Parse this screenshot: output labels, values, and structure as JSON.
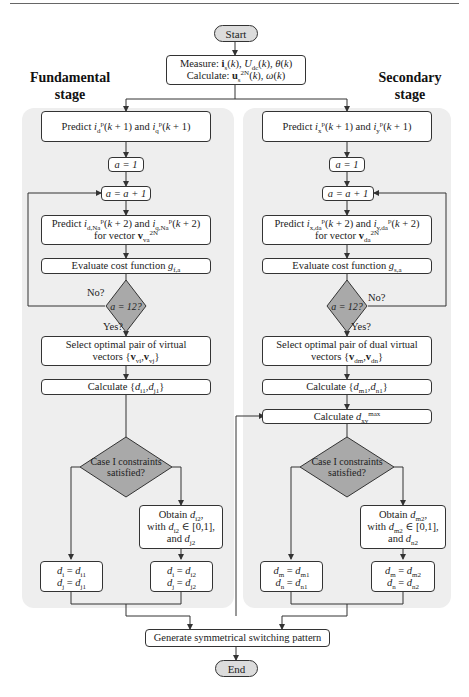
{
  "flowchart": {
    "start": "Start",
    "end": "End",
    "init": {
      "line1_prefix": "Measure: ",
      "line1_vars": "i s (k), U dc (k), θ(k)",
      "line2_prefix": "Calculate: ",
      "line2_vars": "u s 2N (k), ω(k)"
    },
    "generate": "Generate symmetrical switching pattern"
  },
  "fundamental": {
    "title_line1": "Fundamental",
    "title_line2": "stage",
    "predict1": "Predict i_d^p(k+1) and i_q^p(k+1)",
    "init_a": "a = 1",
    "increment": "a = a + 1",
    "predict2_line1": "Predict i_d,Na^p(k+2) and i_q,Na^p(k+2)",
    "predict2_line2": "for vector v_va^2N",
    "evaluate": "Evaluate cost function g_f,a",
    "decision": "a = 12?",
    "no": "No?",
    "yes": "Yes?",
    "select_line1": "Select optimal pair of virtual",
    "select_line2": "vectors {v_vi, v_vj}",
    "calc": "Calculate {d_i1, d_j1}",
    "case_line1": "Case I constraints",
    "case_line2": "satisfied?",
    "obtain_line1": "Obtain d_i2,",
    "obtain_line2": "with d_i2 ∈ [0,1],",
    "obtain_line3": "and d_j2",
    "result1_line1": "d_i = d_i1",
    "result1_line2": "d_j = d_j1",
    "result2_line1": "d_i = d_i2",
    "result2_line2": "d_j = d_j2"
  },
  "secondary": {
    "title_line1": "Secondary",
    "title_line2": "stage",
    "predict1": "Predict i_x^p(k+1) and i_y^p(k+1)",
    "init_a": "a = 1",
    "increment": "a = a + 1",
    "predict2_line1": "Predict i_x,da^p(k+2) and i_y,da^p(k+2)",
    "predict2_line2": "for vector v_da^2N",
    "evaluate": "Evaluate cost function g_s,a",
    "decision": "a = 12?",
    "no": "No?",
    "yes": "Yes?",
    "select_line1": "Select optimal pair of dual virtual",
    "select_line2": "vectors {v_dm, v_dn}",
    "calc": "Calculate {d_m1, d_n1}",
    "calc_max": "Calculate d_xy^max",
    "case_line1": "Case I constraints",
    "case_line2": "satisfied?",
    "obtain_line1": "Obtain d_m2,",
    "obtain_line2": "with d_m2 ∈ [0,1],",
    "obtain_line3": "and d_n2",
    "result1_line1": "d_m = d_m1",
    "result1_line2": "d_n = d_n1",
    "result2_line1": "d_m = d_m2",
    "result2_line2": "d_n = d_n2"
  },
  "colors": {
    "panel": "#eeeeee",
    "terminal": "#dcdcdc",
    "decision": "#a9a9a9",
    "line": "#333333"
  }
}
